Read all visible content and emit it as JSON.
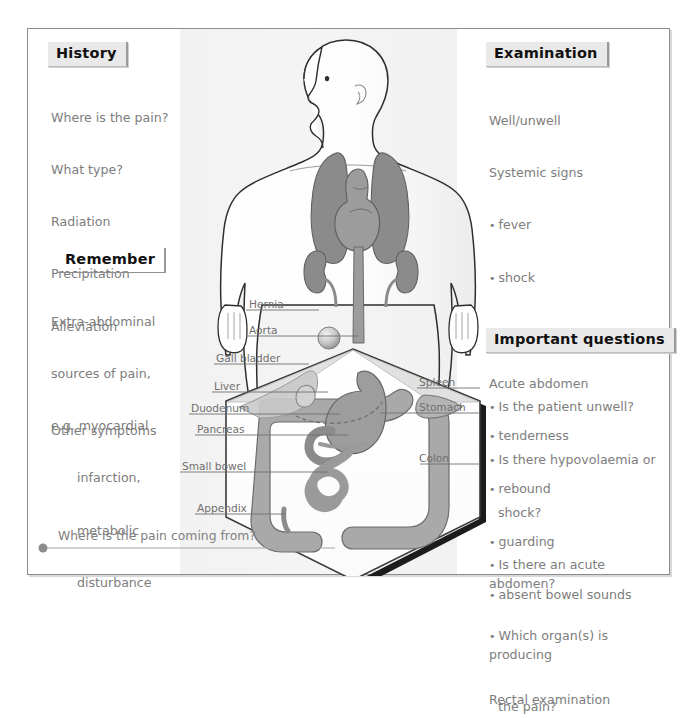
{
  "figure": {
    "caption": "Where is the pain coming from?"
  },
  "panels": {
    "history": {
      "header": "History",
      "lines": [
        "Where is the pain?",
        "What type?",
        "Radiation",
        "Precipitation",
        "Alleviation",
        "",
        "Other symptoms"
      ]
    },
    "remember": {
      "header": "Remember",
      "lines": [
        "Extra-abdominal",
        "sources of pain,",
        "e.g. myocardial",
        "infarction,",
        "metabolic",
        "disturbance"
      ]
    },
    "examination": {
      "header": "Examination",
      "lines": [
        {
          "text": "Well/unwell",
          "style": "plain"
        },
        {
          "text": "Systemic signs",
          "style": "plain"
        },
        {
          "text": "fever",
          "style": "bullet"
        },
        {
          "text": "shock",
          "style": "bullet"
        },
        {
          "text": "",
          "style": "gap"
        },
        {
          "text": "Acute abdomen",
          "style": "plain"
        },
        {
          "text": "tenderness",
          "style": "bullet"
        },
        {
          "text": "rebound",
          "style": "bullet"
        },
        {
          "text": "guarding",
          "style": "bullet"
        },
        {
          "text": "absent bowel sounds",
          "style": "bullet"
        },
        {
          "text": "",
          "style": "gap"
        },
        {
          "text": "Rectal examination",
          "style": "plain"
        }
      ]
    },
    "important_questions": {
      "header": "Important questions",
      "items": [
        {
          "text": "Is the patient unwell?",
          "cont": ""
        },
        {
          "text": "Is there hypovolaemia or",
          "cont": "shock?"
        },
        {
          "text": "Is there an acute abdomen?",
          "cont": ""
        },
        {
          "text": "Which organ(s) is producing",
          "cont": "the pain?"
        }
      ]
    }
  },
  "anatomy_labels": {
    "left": [
      {
        "name": "Hernia",
        "x": 248,
        "y": 296,
        "line_x2": 322,
        "line_y": 309
      },
      {
        "name": "Aorta",
        "x": 248,
        "y": 322,
        "line_x2": 330,
        "line_y": 335
      },
      {
        "name": "Gall bladder",
        "x": 215,
        "y": 350,
        "line_x2": 367,
        "line_y": 363
      },
      {
        "name": "Liver",
        "x": 213,
        "y": 378,
        "line_x2": 375,
        "line_y": 391
      },
      {
        "name": "Duodenum",
        "x": 190,
        "y": 400,
        "line_x2": 360,
        "line_y": 413
      },
      {
        "name": "Pancreas",
        "x": 196,
        "y": 421,
        "line_x2": 352,
        "line_y": 434
      },
      {
        "name": "Small bowel",
        "x": 181,
        "y": 458,
        "line_x2": 340,
        "line_y": 471
      },
      {
        "name": "Appendix",
        "x": 196,
        "y": 500,
        "line_x2": 268,
        "line_y": 513
      }
    ],
    "right": [
      {
        "name": "Spleen",
        "x": 418,
        "y": 374,
        "line_x1": 373,
        "line_y": 387
      },
      {
        "name": "Stomach",
        "x": 418,
        "y": 399,
        "line_x1": 355,
        "line_y": 412
      },
      {
        "name": "Colon",
        "x": 418,
        "y": 450,
        "line_x1": 377,
        "line_y": 463
      }
    ]
  },
  "colors": {
    "organ_dark": "#8b8b8b",
    "organ_light": "#a9a9a9",
    "organ_pale": "#c9c9c9",
    "body_outline": "#3a3a3a",
    "text_grey": "#7d7d7d",
    "header_fill": "#e9e9e9",
    "frame_border": "#8c8c8c",
    "band_fill": "#f2f2f2"
  }
}
